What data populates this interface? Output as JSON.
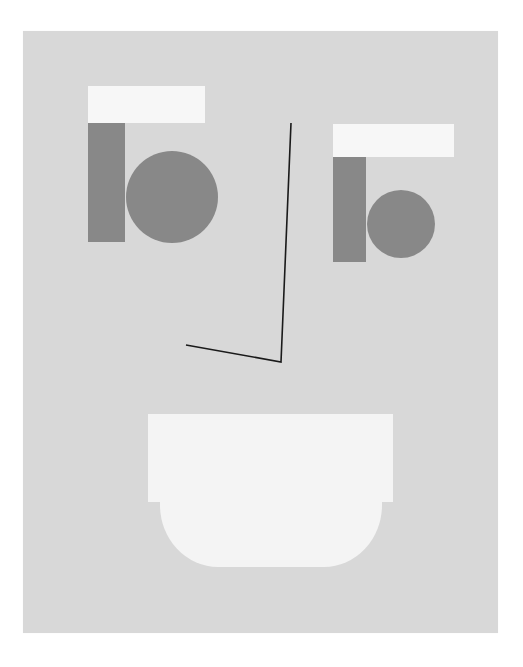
{
  "artwork": {
    "subject": "abstract geometric face",
    "colors": {
      "page_background": "#ffffff",
      "panel": "#d8d8d8",
      "light_shape": "#f7f7f7",
      "dark_shape": "#888888",
      "line": "#1a1a1a"
    },
    "left_eye": {
      "lid": {
        "x": 88,
        "y": 86,
        "w": 117,
        "h": 37
      },
      "block": {
        "x": 88,
        "y": 123,
        "w": 37,
        "h": 119
      },
      "pupil": {
        "cx": 172,
        "cy": 197,
        "r": 46
      }
    },
    "right_eye": {
      "lid": {
        "x": 333,
        "y": 124,
        "w": 121,
        "h": 33
      },
      "block": {
        "x": 333,
        "y": 157,
        "w": 33,
        "h": 105
      },
      "pupil": {
        "cx": 401,
        "cy": 224,
        "r": 34
      }
    },
    "nose": {
      "points": "291,123 281,362 186,345"
    },
    "mouth": {
      "top": {
        "x": 148,
        "y": 414,
        "w": 245,
        "h": 88
      },
      "bottom": {
        "x": 160,
        "y": 501,
        "w": 222,
        "h": 66
      }
    }
  }
}
